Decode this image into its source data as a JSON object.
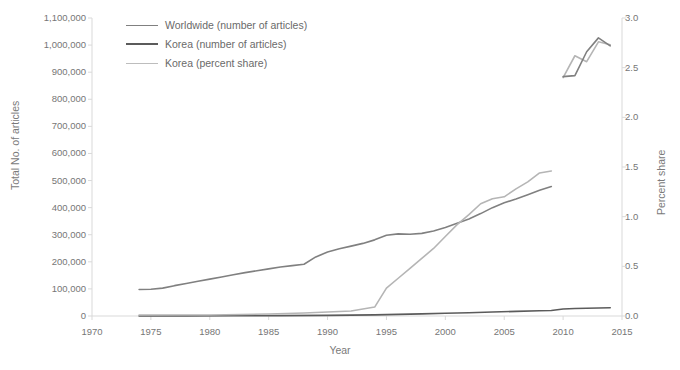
{
  "chart_data": {
    "type": "line",
    "title": "",
    "xlabel": "Year",
    "ylabel": "Total No. of articles",
    "y2label": "Percent share",
    "xlim": [
      1970,
      2015
    ],
    "ylim": [
      0,
      1100000
    ],
    "y2lim": [
      0.0,
      3.0
    ],
    "grid": false,
    "legend_position": "top-left",
    "xticks": [
      "1970",
      "1975",
      "1980",
      "1985",
      "1990",
      "1995",
      "2000",
      "2005",
      "2010",
      "2015"
    ],
    "yticks_left": [
      "0",
      "100,000",
      "200,000",
      "300,000",
      "400,000",
      "500,000",
      "600,000",
      "700,000",
      "800,000",
      "900,000",
      "1,000,000",
      "1,100,000"
    ],
    "yticks_right": [
      "0.0",
      "0.5",
      "1.0",
      "1.5",
      "2.0",
      "2.5",
      "3.0"
    ],
    "series": [
      {
        "name": "Worldwide (number of articles)",
        "axis": "left",
        "color": "#808080",
        "width": 1.6,
        "x": [
          1974,
          1975,
          1976,
          1977,
          1978,
          1979,
          1980,
          1981,
          1982,
          1983,
          1984,
          1985,
          1986,
          1987,
          1988,
          1989,
          1990,
          1991,
          1992,
          1993,
          1994,
          1995,
          1996,
          1997,
          1998,
          1999,
          2000,
          2001,
          2002,
          2003,
          2004,
          2005,
          2006,
          2007,
          2008,
          2009
        ],
        "values": [
          98000,
          99000,
          103000,
          112000,
          120000,
          128000,
          136000,
          144000,
          152000,
          160000,
          167000,
          174000,
          181000,
          186000,
          191000,
          218000,
          236000,
          248000,
          258000,
          268000,
          281000,
          298000,
          303000,
          302000,
          305000,
          314000,
          327000,
          342000,
          358000,
          378000,
          400000,
          418000,
          432000,
          448000,
          464000,
          478000
        ]
      },
      {
        "name": "Korea (number of articles)",
        "axis": "left",
        "color": "#5b5b5b",
        "width": 1.6,
        "x": [
          1974,
          1978,
          1982,
          1986,
          1990,
          1994,
          1996,
          1998,
          2000,
          2002,
          2004,
          2006,
          2008,
          2009,
          2010,
          2011,
          2012,
          2013,
          2014
        ],
        "values": [
          200,
          400,
          700,
          1200,
          2200,
          4000,
          6000,
          8000,
          10000,
          12000,
          14500,
          17000,
          19500,
          20500,
          26000,
          27500,
          28500,
          29500,
          30500
        ]
      },
      {
        "name": "Korea (percent share)",
        "axis": "right",
        "color": "#b5b5b5",
        "width": 1.6,
        "x": [
          1974,
          1980,
          1985,
          1988,
          1990,
          1992,
          1993,
          1994,
          1995,
          1996,
          1997,
          1998,
          1999,
          2000,
          2001,
          2002,
          2003,
          2004,
          2005,
          2006,
          2007,
          2008,
          2009
        ],
        "values": [
          0.01,
          0.01,
          0.02,
          0.03,
          0.04,
          0.05,
          0.07,
          0.09,
          0.28,
          0.38,
          0.48,
          0.58,
          0.68,
          0.8,
          0.92,
          1.02,
          1.13,
          1.18,
          1.2,
          1.28,
          1.35,
          1.44,
          1.46
        ]
      },
      {
        "name": "Korea (percent share, recent)",
        "axis": "right",
        "color": "#b5b5b5",
        "width": 1.6,
        "x": [
          2010,
          2011,
          2012,
          2013,
          2014
        ],
        "values": [
          2.4,
          2.62,
          2.56,
          2.76,
          2.73
        ]
      },
      {
        "name": "Worldwide (recent overlay)",
        "axis": "right",
        "color": "#808080",
        "width": 1.6,
        "x": [
          2010,
          2011,
          2012,
          2013,
          2014
        ],
        "values": [
          2.41,
          2.42,
          2.66,
          2.8,
          2.72
        ]
      }
    ],
    "legend": [
      {
        "label": "Worldwide (number of articles)",
        "color": "#808080",
        "width": 1.3
      },
      {
        "label": "Korea (number of articles)",
        "color": "#5b5b5b",
        "width": 2.0
      },
      {
        "label": "Korea (percent share)",
        "color": "#bdbdbd",
        "width": 1.3
      }
    ]
  },
  "colors": {
    "axis": "#d9d9d9",
    "tick_text": "#767676",
    "background": "#ffffff"
  }
}
